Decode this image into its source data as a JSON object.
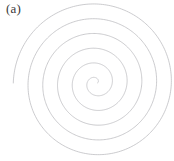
{
  "figure": {
    "panel_label": "(a)",
    "background_color": "#ffffff",
    "width": 174,
    "height": 161
  },
  "chart_data": {
    "type": "line",
    "title": "(a)",
    "subtitle": "",
    "xlabel": "",
    "ylabel": "",
    "grid": false,
    "legend_position": "none",
    "tick_labels": {
      "x": [],
      "y": []
    },
    "annotations": [
      "(a)"
    ],
    "curve": {
      "name": "archimedean-spiral",
      "equation": "r = a + b*theta",
      "center": {
        "x": 96,
        "y": 83
      },
      "a": 1.5,
      "b": 2.35,
      "theta_start_deg": 0,
      "theta_end_deg": 1980,
      "turns": 5.5,
      "stroke_color": "#b9b9bd",
      "stroke_width": 0.75,
      "fill": "none",
      "start_point": {
        "x": 97.5,
        "y": 83
      },
      "end_point": {
        "x": 14,
        "y": 90
      }
    },
    "series": [
      {
        "name": "spiral-radius-by-turn",
        "x": [
          0,
          1,
          2,
          3,
          4,
          5,
          5.5
        ],
        "values": [
          1.5,
          16.3,
          31.0,
          45.8,
          60.6,
          75.3,
          82.7
        ]
      }
    ],
    "xlim": [
      0,
      174
    ],
    "ylim": [
      0,
      161
    ]
  }
}
